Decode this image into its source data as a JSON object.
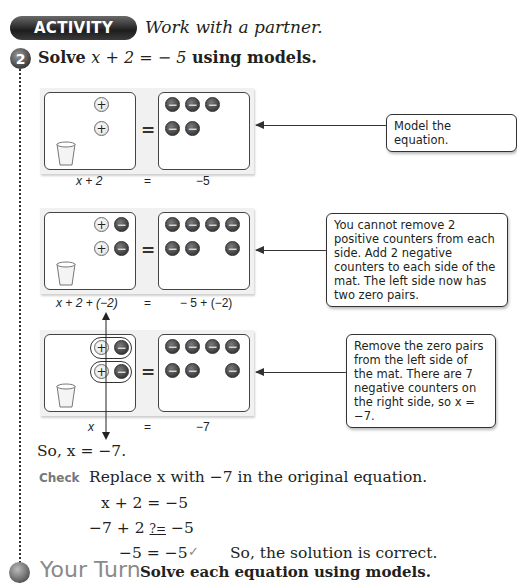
{
  "header": {
    "activity_badge": "ACTIVITY",
    "activity_subtitle": "Work with a partner."
  },
  "step": {
    "number": "2",
    "title_prefix": "Solve ",
    "title_equation": "x + 2 = − 5",
    "title_suffix": " using models."
  },
  "counter_symbols": {
    "positive": "+",
    "negative": "−"
  },
  "models": [
    {
      "left_positive": 2,
      "left_negative": 0,
      "right_negative": 5,
      "label_left": "x + 2",
      "label_equals": "=",
      "label_right": "−5",
      "callout": "Model the equation."
    },
    {
      "left_positive": 2,
      "left_negative": 2,
      "right_negative": 7,
      "label_left": "x + 2 + (−2)",
      "label_equals": "=",
      "label_right": "− 5 + (−2)",
      "callout": "You cannot remove 2 positive counters from each side. Add 2 negative counters to each side of the mat. The left side now has two zero pairs."
    },
    {
      "left_positive": 2,
      "left_negative": 2,
      "right_negative": 7,
      "zero_pairs_circled": true,
      "label_left": "x",
      "label_equals": "=",
      "label_right": "−7",
      "callout": "Remove the zero pairs from the left side of the mat. There are 7 negative counters on the right side, so x = −7."
    }
  ],
  "conclusion": "So, x = −7.",
  "check": {
    "label": "Check",
    "instruction": "Replace x with −7 in the original equation.",
    "lines": [
      "x + 2 = −5",
      "−7 + 2",
      "?=",
      "−5",
      "−5 = −5"
    ],
    "checkmark": "✓",
    "result": "So, the solution is correct."
  },
  "your_turn": {
    "label": "Your Turn",
    "text": "Solve each equation using models."
  }
}
